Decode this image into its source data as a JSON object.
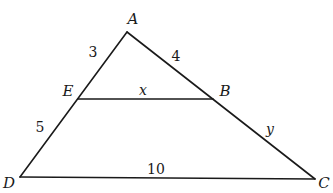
{
  "diagram": {
    "type": "triangle-with-parallel-segment",
    "stroke_color": "#1a1a1a",
    "background": "#ffffff",
    "vertices": {
      "A": {
        "label": "A",
        "x": 127,
        "y": 32,
        "label_x": 133,
        "label_y": 24
      },
      "B": {
        "label": "B",
        "x": 213,
        "y": 99,
        "label_x": 225,
        "label_y": 96
      },
      "C": {
        "label": "C",
        "x": 315,
        "y": 179,
        "label_x": 324,
        "label_y": 188
      },
      "D": {
        "label": "D",
        "x": 20,
        "y": 177,
        "label_x": 9,
        "label_y": 188
      },
      "E": {
        "label": "E",
        "x": 78,
        "y": 99,
        "label_x": 68,
        "label_y": 96
      }
    },
    "segments": [
      {
        "from": "A",
        "to": "D"
      },
      {
        "from": "A",
        "to": "C"
      },
      {
        "from": "D",
        "to": "C"
      },
      {
        "from": "E",
        "to": "B"
      }
    ],
    "measures": {
      "AE": "3",
      "AB": "4",
      "ED": "5",
      "EB": "x",
      "BC": "y",
      "DC": "10"
    }
  }
}
